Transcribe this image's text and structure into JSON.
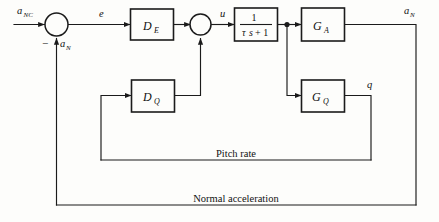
{
  "figure": {
    "type": "control-system-block-diagram",
    "background_color": "#fdfdfb",
    "line_color": "#1b1b1b",
    "text_color": "#111111"
  },
  "signals": {
    "command_input": {
      "base": "a",
      "sub": "NC",
      "full": "a_NC"
    },
    "error": {
      "base": "e",
      "sub": "",
      "full": "e"
    },
    "control": {
      "base": "u",
      "sub": "",
      "full": "u"
    },
    "acceleration_feedback": {
      "base": "a",
      "sub": "N",
      "full": "a_N"
    },
    "acceleration_output": {
      "base": "a",
      "sub": "N",
      "full": "a_N"
    },
    "pitch_rate_output": {
      "base": "q",
      "sub": "",
      "full": "q"
    },
    "negative_sign": "−"
  },
  "blocks": [
    {
      "id": "D_E",
      "base": "D",
      "sub": "E",
      "label": "D_E",
      "role": "error-compensator"
    },
    {
      "id": "lag",
      "numerator": "1",
      "denominator_tau": "τ",
      "denominator_s": "s",
      "denominator_rest": "+ 1",
      "label": "1/(τs + 1)",
      "role": "actuator-lag"
    },
    {
      "id": "G_A",
      "base": "G",
      "sub": "A",
      "label": "G_A",
      "role": "acceleration-plant"
    },
    {
      "id": "D_Q",
      "base": "D",
      "sub": "Q",
      "label": "D_Q",
      "role": "rate-compensator"
    },
    {
      "id": "G_Q",
      "base": "G",
      "sub": "Q",
      "label": "G_Q",
      "role": "rate-plant"
    }
  ],
  "summing_junctions": [
    {
      "id": "sum-1",
      "inputs": [
        "a_NC",
        "a_N"
      ],
      "signs": [
        "+",
        "−"
      ],
      "output": "e"
    },
    {
      "id": "sum-2",
      "inputs": [
        "D_E",
        "D_Q"
      ],
      "signs": [
        "+",
        "+"
      ],
      "output": "u"
    }
  ],
  "feedback_paths": [
    {
      "id": "pitch-rate-path",
      "label": "Pitch rate",
      "from": "G_Q",
      "to": "D_Q"
    },
    {
      "id": "normal-acceleration-path",
      "label": "Normal acceleration",
      "from": "G_A",
      "to": "sum-1"
    }
  ],
  "path_labels": {
    "pitch_rate": "Pitch rate",
    "normal_acceleration": "Normal acceleration"
  }
}
